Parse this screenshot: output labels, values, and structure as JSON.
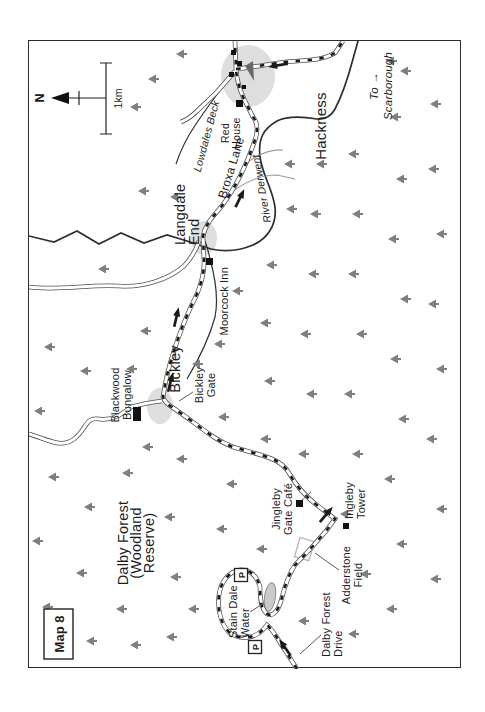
{
  "page": {
    "map_label": "Map 8"
  },
  "compass": {
    "north_label": "N"
  },
  "scale_bar": {
    "label": "1km"
  },
  "parking": {
    "label": "P"
  },
  "colors": {
    "tree": "#7c817c",
    "village_blob": "#dedede",
    "lake_fill": "#c9c9c9",
    "lake_stroke": "#848484",
    "route": "#1a1a1a",
    "river": "#2e2e2e",
    "road_casing": "#4d4d4d",
    "road_fill": "#ffffff",
    "track": "#9a9a9a",
    "leader": "#5a5a5a",
    "building": "#111111",
    "church": "#696969",
    "enclosure": "#b3b3b3"
  },
  "labels": [
    {
      "id": "dalby-forest-title",
      "lines": [
        "Dalby Forest",
        "(Woodland",
        "Reserve)"
      ],
      "x": 126,
      "y": 99,
      "size": 14.5,
      "anchor": "middle",
      "lh": 13
    },
    {
      "id": "stain-dale-water",
      "lines": [
        "Stain Dale",
        "Water"
      ],
      "x": 31,
      "y": 208,
      "size": 11,
      "anchor": "start",
      "lh": 11.5
    },
    {
      "id": "dalby-forest-drive",
      "lines": [
        "Dalby Forest",
        "Drive"
      ],
      "x": 12,
      "y": 301,
      "size": 11,
      "anchor": "start",
      "lh": 11.5
    },
    {
      "id": "adderstone-field",
      "lines": [
        "Adderstone",
        "Field"
      ],
      "x": 94,
      "y": 321,
      "size": 11,
      "anchor": "middle",
      "lh": 11.5
    },
    {
      "id": "jingleby-gate-cafe",
      "lines": [
        "Jingleby",
        "Gate Café"
      ],
      "x": 160,
      "y": 251,
      "size": 11,
      "anchor": "middle",
      "lh": 11.5
    },
    {
      "id": "ingleby-tower",
      "lines": [
        "Ingleby",
        "Tower"
      ],
      "x": 150,
      "y": 324,
      "size": 11,
      "anchor": "start",
      "lh": 11.5
    },
    {
      "id": "bickley",
      "lines": [
        "Bickley"
      ],
      "x": 300,
      "y": 151,
      "size": 14.5,
      "anchor": "middle"
    },
    {
      "id": "bickley-gate",
      "lines": [
        "Bickley",
        "Gate"
      ],
      "x": 284,
      "y": 174,
      "size": 11,
      "anchor": "middle",
      "lh": 11.5
    },
    {
      "id": "blackwood-bungalow",
      "lines": [
        "Blackwood",
        "Bungalow"
      ],
      "x": 274,
      "y": 90,
      "size": 11,
      "anchor": "middle",
      "lh": 11.5
    },
    {
      "id": "moorcock-inn",
      "lines": [
        "Moorcock Inn"
      ],
      "x": 402,
      "y": 199,
      "size": 11,
      "anchor": "end"
    },
    {
      "id": "langdale-end",
      "lines": [
        "Langdale",
        "End"
      ],
      "x": 424,
      "y": 156,
      "size": 14.5,
      "anchor": "start",
      "lh": 14
    },
    {
      "id": "broxa-lane",
      "lines": [
        "Broxa Lane"
      ],
      "x": 500,
      "y": 206,
      "size": 12,
      "anchor": "middle",
      "rot": 17
    },
    {
      "id": "river-derwent",
      "lines": [
        "River Derwent"
      ],
      "x": 481,
      "y": 236,
      "size": 10.5,
      "anchor": "middle",
      "rot": -10,
      "italic": true
    },
    {
      "id": "lowdales-beck",
      "lines": [
        "Lowdales Beck"
      ],
      "x": 532,
      "y": 181,
      "size": 10.5,
      "anchor": "middle",
      "rot": 15,
      "italic": true
    },
    {
      "id": "red-house",
      "lines": [
        "Red",
        "House"
      ],
      "x": 536,
      "y": 200,
      "size": 10.5,
      "anchor": "middle",
      "lh": 11
    },
    {
      "id": "hackness",
      "lines": [
        "Hackness"
      ],
      "x": 543,
      "y": 297,
      "size": 15,
      "anchor": "middle"
    },
    {
      "id": "to-scarborough",
      "lines": [
        "To →",
        "Scarborough"
      ],
      "x": 583,
      "y": 349,
      "size": 11.5,
      "anchor": "middle",
      "lh": 13.5,
      "italic": true
    }
  ],
  "trees": [
    [
      62,
      24
    ],
    [
      128,
      14
    ],
    [
      192,
      30
    ],
    [
      258,
      16
    ],
    [
      322,
      26
    ],
    [
      28,
      68
    ],
    [
      96,
      58
    ],
    [
      162,
      66
    ],
    [
      298,
      62
    ],
    [
      400,
      80
    ],
    [
      24,
      112
    ],
    [
      60,
      98
    ],
    [
      196,
      104
    ],
    [
      222,
      124
    ],
    [
      300,
      108
    ],
    [
      338,
      122
    ],
    [
      478,
      120
    ],
    [
      562,
      112
    ],
    [
      590,
      130
    ],
    [
      32,
      148
    ],
    [
      92,
      152
    ],
    [
      152,
      146
    ],
    [
      210,
      158
    ],
    [
      60,
      170
    ],
    [
      472,
      152
    ],
    [
      615,
      158
    ],
    [
      305,
      174
    ],
    [
      140,
      198
    ],
    [
      185,
      208
    ],
    [
      252,
      200
    ],
    [
      325,
      196
    ],
    [
      378,
      214
    ],
    [
      120,
      238
    ],
    [
      230,
      242
    ],
    [
      288,
      246
    ],
    [
      346,
      242
    ],
    [
      404,
      248
    ],
    [
      460,
      268
    ],
    [
      505,
      266
    ],
    [
      48,
      280
    ],
    [
      215,
      280
    ],
    [
      275,
      288
    ],
    [
      335,
      282
    ],
    [
      395,
      290
    ],
    [
      455,
      292
    ],
    [
      505,
      298
    ],
    [
      35,
      330
    ],
    [
      95,
      342
    ],
    [
      155,
      322
    ],
    [
      215,
      334
    ],
    [
      275,
      326
    ],
    [
      335,
      338
    ],
    [
      395,
      330
    ],
    [
      455,
      334
    ],
    [
      515,
      330
    ],
    [
      60,
      368
    ],
    [
      125,
      378
    ],
    [
      190,
      366
    ],
    [
      250,
      380
    ],
    [
      310,
      372
    ],
    [
      370,
      382
    ],
    [
      430,
      370
    ],
    [
      490,
      378
    ],
    [
      552,
      372
    ],
    [
      598,
      382
    ],
    [
      90,
      412
    ],
    [
      160,
      418
    ],
    [
      230,
      408
    ],
    [
      300,
      418
    ],
    [
      365,
      410
    ],
    [
      435,
      418
    ],
    [
      500,
      410
    ],
    [
      565,
      412
    ],
    [
      608,
      368
    ]
  ],
  "route_arrows": [
    [
      20,
      257,
      -35
    ],
    [
      153,
      296,
      40
    ],
    [
      285,
      141,
      14
    ],
    [
      350,
      147,
      13
    ],
    [
      469,
      210,
      26
    ],
    [
      604,
      251,
      -99
    ]
  ],
  "parking_spots": [
    [
      94,
      212
    ],
    [
      22,
      226
    ]
  ]
}
